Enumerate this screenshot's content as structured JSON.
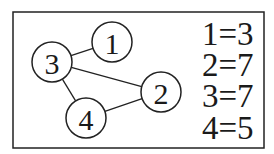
{
  "diagram": {
    "type": "graph",
    "nodes": [
      {
        "id": "1",
        "label": "1",
        "cx": 112,
        "cy": 42,
        "r": 20
      },
      {
        "id": "2",
        "label": "2",
        "cx": 161,
        "cy": 92,
        "r": 20
      },
      {
        "id": "3",
        "label": "3",
        "cx": 52,
        "cy": 62,
        "r": 20
      },
      {
        "id": "4",
        "label": "4",
        "cx": 86,
        "cy": 118,
        "r": 20
      }
    ],
    "edges": [
      {
        "from": "3",
        "to": "1"
      },
      {
        "from": "3",
        "to": "2"
      },
      {
        "from": "3",
        "to": "4"
      },
      {
        "from": "4",
        "to": "2"
      }
    ],
    "legend": [
      {
        "text": "1=3"
      },
      {
        "text": "2=7"
      },
      {
        "text": "3=7"
      },
      {
        "text": "4=5"
      }
    ]
  }
}
